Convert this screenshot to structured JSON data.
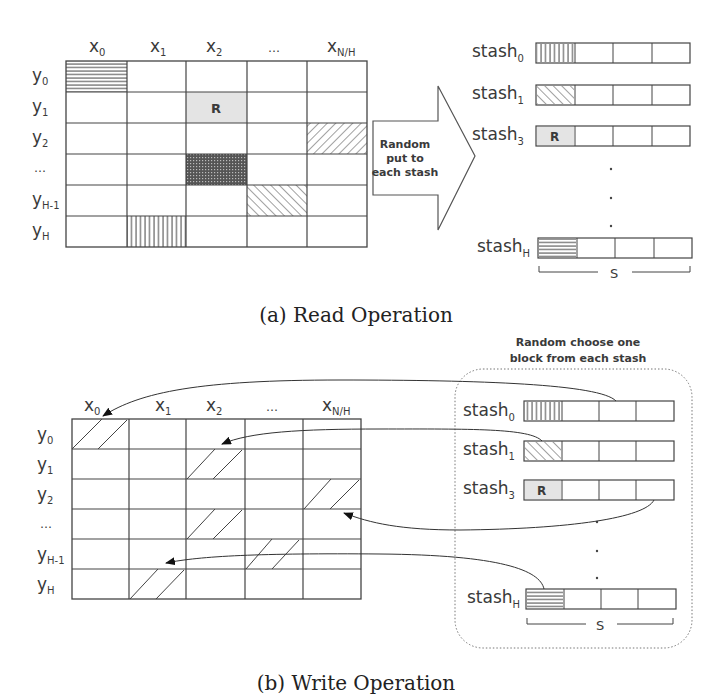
{
  "read": {
    "caption": "(a) Read Operation",
    "columns": [
      {
        "base": "x",
        "sub": "0"
      },
      {
        "base": "x",
        "sub": "1"
      },
      {
        "base": "x",
        "sub": "2"
      },
      {
        "base": "…",
        "sub": ""
      },
      {
        "base": "x",
        "sub": "N/H"
      }
    ],
    "rows": [
      {
        "base": "y",
        "sub": "0"
      },
      {
        "base": "y",
        "sub": "1"
      },
      {
        "base": "y",
        "sub": "2"
      },
      {
        "base": "…",
        "sub": ""
      },
      {
        "base": "y",
        "sub": "H-1"
      },
      {
        "base": "y",
        "sub": "H"
      }
    ],
    "cell_marker": "R",
    "arrow_label": [
      "Random",
      "put to",
      "each stash"
    ],
    "stashes": [
      {
        "base": "stash",
        "sub": "0",
        "first": "vertical"
      },
      {
        "base": "stash",
        "sub": "1",
        "first": "diag-down"
      },
      {
        "base": "stash",
        "sub": "3",
        "first": "R"
      },
      {
        "base": "stash",
        "sub": "H",
        "first": "horizontal"
      }
    ],
    "size_label": "S"
  },
  "write": {
    "caption": "(b) Write Operation",
    "box_title": [
      "Random choose one",
      "block from each stash"
    ],
    "columns": [
      {
        "base": "x",
        "sub": "0"
      },
      {
        "base": "x",
        "sub": "1"
      },
      {
        "base": "x",
        "sub": "2"
      },
      {
        "base": "…",
        "sub": ""
      },
      {
        "base": "x",
        "sub": "N/H"
      }
    ],
    "rows": [
      {
        "base": "y",
        "sub": "0"
      },
      {
        "base": "y",
        "sub": "1"
      },
      {
        "base": "y",
        "sub": "2"
      },
      {
        "base": "…",
        "sub": ""
      },
      {
        "base": "y",
        "sub": "H-1"
      },
      {
        "base": "y",
        "sub": "H"
      }
    ],
    "stashes": [
      {
        "base": "stash",
        "sub": "0",
        "first": "vertical"
      },
      {
        "base": "stash",
        "sub": "1",
        "first": "diag-down"
      },
      {
        "base": "stash",
        "sub": "3",
        "first": "R"
      },
      {
        "base": "stash",
        "sub": "H",
        "first": "horizontal"
      }
    ],
    "cell_marker": "R",
    "size_label": "S"
  }
}
